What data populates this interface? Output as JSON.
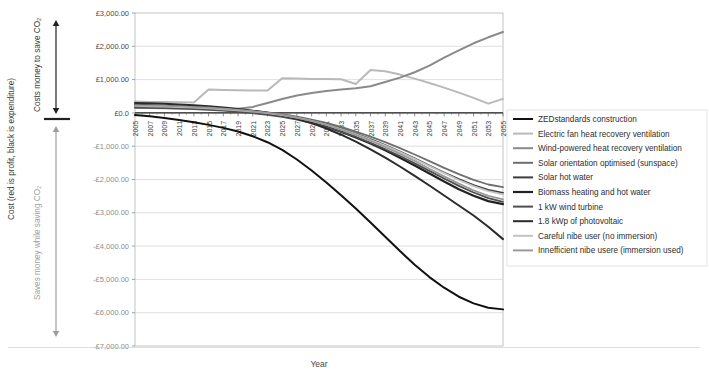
{
  "chart_data": {
    "type": "line",
    "title": "",
    "xlabel": "Year",
    "ylabel": "Cost (red is profit, black is expenditure)",
    "ylim": [
      -7000,
      3000
    ],
    "xlim": [
      2005,
      2055
    ],
    "ytick_labels": [
      "£3,000.00",
      "£2,000.00",
      "£1,000.00",
      "£0.0",
      "-£1,000.00",
      "-£2,000.00",
      "-£3,000.00",
      "-£4,000.00",
      "-£5,000.00",
      "-£6,000.00",
      "-£7,000.00"
    ],
    "ytick_values": [
      3000,
      2000,
      1000,
      0,
      -1000,
      -2000,
      -3000,
      -4000,
      -5000,
      -6000,
      -7000
    ],
    "ycurrency_prefix": "£",
    "xtick_labels": [
      "2005",
      "2007",
      "2009",
      "2011",
      "2013",
      "2015",
      "2017",
      "2019",
      "2021",
      "2023",
      "2025",
      "2027",
      "2029",
      "2031",
      "2033",
      "2035",
      "2037",
      "2039",
      "2041",
      "2043",
      "2045",
      "2047",
      "2049",
      "2051",
      "2053",
      "2055"
    ],
    "x": [
      2005,
      2007,
      2009,
      2011,
      2013,
      2015,
      2017,
      2019,
      2021,
      2023,
      2025,
      2027,
      2029,
      2031,
      2033,
      2035,
      2037,
      2039,
      2041,
      2043,
      2045,
      2047,
      2049,
      2051,
      2053,
      2055
    ],
    "grid": true,
    "grid_axis": "y",
    "legend_position": "right",
    "series": [
      {
        "name": "ZEDstandards construction",
        "color": "#111111",
        "width": 2.0,
        "values": [
          -60,
          -100,
          -150,
          -210,
          -280,
          -360,
          -450,
          -560,
          -700,
          -880,
          -1110,
          -1400,
          -1730,
          -2090,
          -2470,
          -2870,
          -3290,
          -3720,
          -4150,
          -4560,
          -4930,
          -5250,
          -5520,
          -5720,
          -5850,
          -5900
        ]
      },
      {
        "name": "Electric fan heat recovery ventilation",
        "color": "#b9b9b9",
        "width": 2.0,
        "values": [
          340,
          330,
          325,
          320,
          315,
          700,
          690,
          680,
          675,
          670,
          1040,
          1030,
          1020,
          1015,
          1010,
          870,
          1290,
          1250,
          1150,
          1030,
          900,
          760,
          610,
          450,
          280,
          420
        ]
      },
      {
        "name": "Wind-powered heat recovery ventilation",
        "color": "#8a8a8a",
        "width": 2.0,
        "values": [
          150,
          145,
          140,
          138,
          135,
          130,
          128,
          125,
          180,
          300,
          420,
          520,
          600,
          660,
          700,
          740,
          800,
          930,
          1060,
          1220,
          1420,
          1660,
          1880,
          2090,
          2270,
          2430
        ]
      },
      {
        "name": "Solar orientation optimised (sunspace)",
        "color": "#6f6f6f",
        "width": 1.8,
        "values": [
          200,
          190,
          180,
          170,
          155,
          140,
          120,
          95,
          60,
          15,
          -40,
          -110,
          -200,
          -300,
          -420,
          -560,
          -710,
          -880,
          -1060,
          -1250,
          -1450,
          -1650,
          -1840,
          -2010,
          -2150,
          -2230
        ]
      },
      {
        "name": "Solar hot water",
        "color": "#3d3d3d",
        "width": 1.8,
        "values": [
          190,
          180,
          170,
          158,
          142,
          124,
          102,
          74,
          38,
          -8,
          -65,
          -140,
          -235,
          -345,
          -475,
          -620,
          -785,
          -965,
          -1160,
          -1365,
          -1580,
          -1790,
          -1990,
          -2170,
          -2310,
          -2400
        ]
      },
      {
        "name": "Biomass heating and hot water",
        "color": "#222222",
        "width": 2.2,
        "values": [
          240,
          228,
          214,
          198,
          178,
          154,
          124,
          88,
          44,
          -12,
          -82,
          -172,
          -285,
          -415,
          -565,
          -735,
          -920,
          -1125,
          -1345,
          -1580,
          -1820,
          -2060,
          -2290,
          -2490,
          -2650,
          -2740
        ]
      },
      {
        "name": "1 kW wind turbine",
        "color": "#4f4f4f",
        "width": 1.8,
        "values": [
          165,
          155,
          144,
          130,
          113,
          92,
          66,
          32,
          -8,
          -58,
          -122,
          -204,
          -306,
          -426,
          -566,
          -724,
          -898,
          -1090,
          -1296,
          -1516,
          -1742,
          -1970,
          -2190,
          -2390,
          -2560,
          -2670
        ]
      },
      {
        "name": "1.8 kWp of photovoltaic",
        "color": "#2b2b2b",
        "width": 2.0,
        "values": [
          300,
          288,
          272,
          252,
          228,
          198,
          162,
          118,
          66,
          4,
          -72,
          -176,
          -308,
          -468,
          -655,
          -865,
          -1095,
          -1345,
          -1610,
          -1890,
          -2180,
          -2480,
          -2780,
          -3080,
          -3420,
          -3790
        ]
      },
      {
        "name": "Careful nibe user (no immersion)",
        "color": "#c2c2c2",
        "width": 1.8,
        "values": [
          210,
          200,
          188,
          174,
          157,
          136,
          110,
          78,
          40,
          -8,
          -68,
          -144,
          -240,
          -355,
          -490,
          -640,
          -805,
          -985,
          -1175,
          -1380,
          -1595,
          -1810,
          -2015,
          -2200,
          -2350,
          -2450
        ]
      },
      {
        "name": "Innefficient nibe usere (immersion used)",
        "color": "#9a9a9a",
        "width": 1.8,
        "values": [
          230,
          220,
          208,
          194,
          176,
          154,
          126,
          92,
          52,
          2,
          -60,
          -140,
          -242,
          -362,
          -502,
          -660,
          -835,
          -1025,
          -1230,
          -1445,
          -1675,
          -1905,
          -2125,
          -2325,
          -2490,
          -2600
        ]
      }
    ]
  },
  "side_labels": {
    "outer": "Cost (red is profit, black is expenditure)",
    "upper": "Costs money to save CO₂",
    "lower": "Saves money while saving CO₂"
  },
  "axis": {
    "x_title": "Year"
  }
}
